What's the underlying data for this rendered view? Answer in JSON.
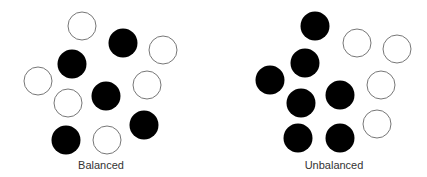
{
  "diagrams": [
    {
      "id": "balanced",
      "caption": "Balanced",
      "circles": [
        {
          "style": "open"
        },
        {
          "style": "filled"
        },
        {
          "style": "open"
        },
        {
          "style": "filled"
        },
        {
          "style": "open"
        },
        {
          "style": "open"
        },
        {
          "style": "filled"
        },
        {
          "style": "open"
        },
        {
          "style": "filled"
        },
        {
          "style": "filled"
        },
        {
          "style": "open"
        }
      ]
    },
    {
      "id": "unbalanced",
      "caption": "Unbalanced",
      "circles": [
        {
          "style": "filled"
        },
        {
          "style": "open"
        },
        {
          "style": "open"
        },
        {
          "style": "filled"
        },
        {
          "style": "filled"
        },
        {
          "style": "open"
        },
        {
          "style": "filled"
        },
        {
          "style": "filled"
        },
        {
          "style": "open"
        },
        {
          "style": "filled"
        },
        {
          "style": "filled"
        }
      ]
    }
  ],
  "colors": {
    "filled": "#000000",
    "open_stroke": "#777777",
    "open_fill": "#ffffff",
    "background": "#ffffff"
  }
}
